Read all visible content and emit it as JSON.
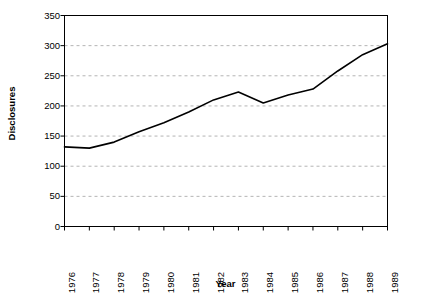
{
  "chart_data": {
    "type": "line",
    "title": "",
    "xlabel": "Year",
    "ylabel": "Disclosures",
    "categories": [
      "1976",
      "1977",
      "1978",
      "1979",
      "1980",
      "1981",
      "1982",
      "1983",
      "1984",
      "1985",
      "1986",
      "1987",
      "1988",
      "1989"
    ],
    "values": [
      132,
      130,
      140,
      157,
      172,
      190,
      210,
      223,
      205,
      218,
      228,
      258,
      285,
      303
    ],
    "series": [
      {
        "name": "Disclosures",
        "values": [
          132,
          130,
          140,
          157,
          172,
          190,
          210,
          223,
          205,
          218,
          228,
          258,
          285,
          303
        ]
      }
    ],
    "ylim": [
      0,
      350
    ],
    "ytick_step": 50,
    "yticks": [
      0,
      50,
      100,
      150,
      200,
      250,
      300,
      350
    ],
    "ytick_labels": [
      "0",
      "50",
      "100",
      "150",
      "200",
      "250",
      "300",
      "350"
    ],
    "grid": true,
    "grid_axis": "y",
    "grid_style": "dashed",
    "legend": false,
    "legend_position": "none",
    "xtick_rotation": 90,
    "colors": {
      "line": "#000000",
      "grid": "#b4b4b4",
      "axis": "#000000",
      "background": "#ffffff",
      "text": "#000000"
    }
  }
}
